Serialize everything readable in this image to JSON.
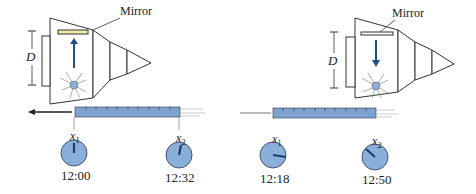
{
  "diagram": {
    "panels": [
      {
        "name": "left",
        "mirror_label": "Mirror",
        "distance_label": "D",
        "light_direction": "up",
        "motion_direction": "left",
        "clocks": [
          {
            "label": "x",
            "sub": "1",
            "time": "12:00"
          },
          {
            "label": "x",
            "sub": "2",
            "time": "12:32"
          }
        ]
      },
      {
        "name": "right",
        "mirror_label": "Mirror",
        "distance_label": "D",
        "light_direction": "down",
        "motion_direction": "left",
        "clocks": [
          {
            "label": "x",
            "sub": "1",
            "time": "12:18"
          },
          {
            "label": "x",
            "sub": "2",
            "time": "12:50"
          }
        ]
      }
    ],
    "colors": {
      "ruler": "#7fa3cf",
      "clock_face": "#8aafd9",
      "arrow": "#1f4f8a",
      "line": "#333333"
    }
  }
}
